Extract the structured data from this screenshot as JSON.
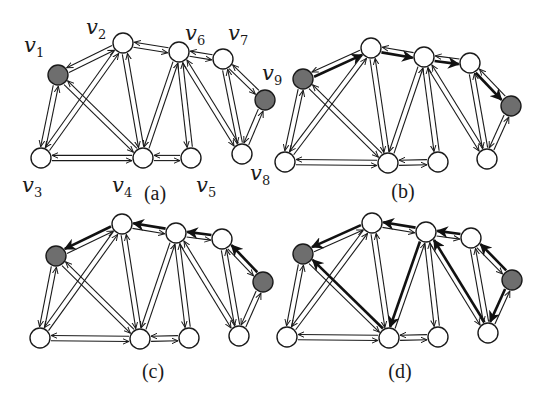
{
  "figure": {
    "node_radius": 10,
    "colors": {
      "highlight_node": "#6e6e6e",
      "normal_node": "#ffffff",
      "stroke": "#1a1a1a"
    },
    "edges": [
      [
        "v1",
        "v2"
      ],
      [
        "v1",
        "v3"
      ],
      [
        "v1",
        "v4"
      ],
      [
        "v2",
        "v3"
      ],
      [
        "v2",
        "v4"
      ],
      [
        "v2",
        "v6"
      ],
      [
        "v3",
        "v4"
      ],
      [
        "v4",
        "v5"
      ],
      [
        "v4",
        "v6"
      ],
      [
        "v5",
        "v6"
      ],
      [
        "v6",
        "v7"
      ],
      [
        "v6",
        "v8"
      ],
      [
        "v7",
        "v8"
      ],
      [
        "v7",
        "v9"
      ],
      [
        "v8",
        "v9"
      ]
    ],
    "highlighted_nodes": [
      "v1",
      "v9"
    ],
    "panels": [
      {
        "caption": "(a)",
        "caption_pos": [
          155,
          200
        ],
        "show_labels": true,
        "nodes": {
          "v1": [
            58,
            75
          ],
          "v2": [
            123,
            43
          ],
          "v3": [
            41,
            158
          ],
          "v4": [
            143,
            158
          ],
          "v5": [
            191,
            158
          ],
          "v6": [
            179,
            52
          ],
          "v7": [
            223,
            59
          ],
          "v8": [
            242,
            154
          ],
          "v9": [
            265,
            100
          ]
        },
        "labels": {
          "v1": {
            "text": "v",
            "sub": "1",
            "pos": [
              24,
              52
            ]
          },
          "v2": {
            "text": "v",
            "sub": "2",
            "pos": [
              86,
              34
            ]
          },
          "v3": {
            "text": "v",
            "sub": "3",
            "pos": [
              22,
              192
            ]
          },
          "v4": {
            "text": "v",
            "sub": "4",
            "pos": [
              112,
              192
            ]
          },
          "v5": {
            "text": "v",
            "sub": "5",
            "pos": [
              196,
              192
            ]
          },
          "v6": {
            "text": "v",
            "sub": "6",
            "pos": [
              185,
              40
            ]
          },
          "v7": {
            "text": "v",
            "sub": "7",
            "pos": [
              228,
              40
            ]
          },
          "v8": {
            "text": "v",
            "sub": "8",
            "pos": [
              250,
              180
            ]
          },
          "v9": {
            "text": "v",
            "sub": "9",
            "pos": [
              262,
              80
            ]
          }
        },
        "thick_arrows": []
      },
      {
        "caption": "(b)",
        "caption_pos": [
          403,
          198
        ],
        "show_labels": false,
        "nodes": {
          "v1": [
            303,
            79
          ],
          "v2": [
            371,
            48
          ],
          "v3": [
            285,
            162
          ],
          "v4": [
            388,
            163
          ],
          "v5": [
            438,
            162
          ],
          "v6": [
            424,
            57
          ],
          "v7": [
            470,
            63
          ],
          "v8": [
            487,
            159
          ],
          "v9": [
            511,
            106
          ]
        },
        "thick_arrows": [
          [
            "v1",
            "v2"
          ],
          [
            "v2",
            "v6"
          ],
          [
            "v6",
            "v7"
          ],
          [
            "v7",
            "v9"
          ]
        ]
      },
      {
        "caption": "(c)",
        "caption_pos": [
          153,
          378
        ],
        "show_labels": false,
        "nodes": {
          "v1": [
            56,
            256
          ],
          "v2": [
            122,
            224
          ],
          "v3": [
            40,
            338
          ],
          "v4": [
            140,
            339
          ],
          "v5": [
            189,
            338
          ],
          "v6": [
            176,
            233
          ],
          "v7": [
            222,
            239
          ],
          "v8": [
            239,
            336
          ],
          "v9": [
            263,
            282
          ]
        },
        "thick_arrows": [
          [
            "v9",
            "v7"
          ],
          [
            "v7",
            "v6"
          ],
          [
            "v6",
            "v2"
          ],
          [
            "v2",
            "v1"
          ]
        ]
      },
      {
        "caption": "(d)",
        "caption_pos": [
          400,
          378
        ],
        "show_labels": false,
        "nodes": {
          "v1": [
            303,
            254
          ],
          "v2": [
            372,
            223
          ],
          "v3": [
            287,
            337
          ],
          "v4": [
            389,
            338
          ],
          "v5": [
            438,
            337
          ],
          "v6": [
            426,
            232
          ],
          "v7": [
            471,
            238
          ],
          "v8": [
            488,
            333
          ],
          "v9": [
            512,
            280
          ]
        },
        "thick_arrows": [
          [
            "v2",
            "v1"
          ],
          [
            "v6",
            "v2"
          ],
          [
            "v7",
            "v6"
          ],
          [
            "v9",
            "v7"
          ],
          [
            "v4",
            "v1"
          ],
          [
            "v6",
            "v4"
          ],
          [
            "v8",
            "v6"
          ],
          [
            "v9",
            "v8"
          ]
        ]
      }
    ]
  }
}
